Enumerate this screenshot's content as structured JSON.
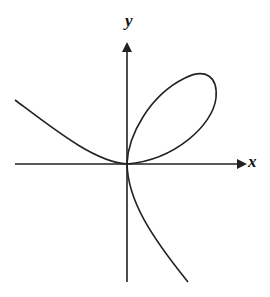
{
  "diagram": {
    "title": "",
    "axes": {
      "x_label": "x",
      "y_label": "y"
    },
    "curve": {
      "description": "Curve with a loop in the first quadrant passing through origin, a branch extending to upper-left, and a branch descending to lower-right",
      "stroke_color": "#222222"
    },
    "colors": {
      "background": "#ffffff",
      "ink": "#222222"
    }
  }
}
